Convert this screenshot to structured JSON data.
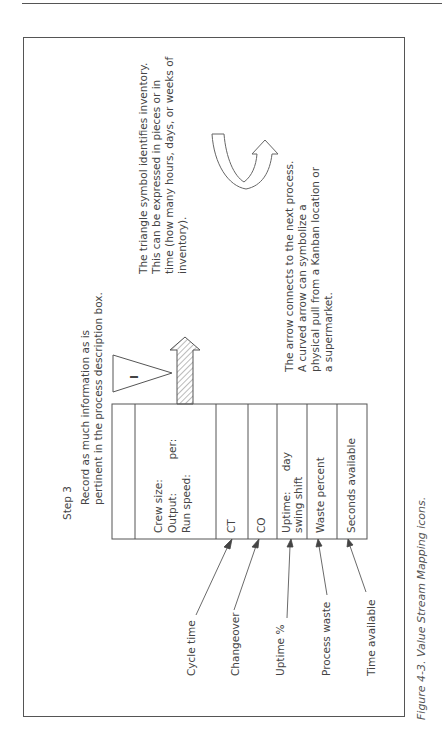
{
  "figure": {
    "step_label": "Step 3",
    "instruction_lines": [
      "Record as much information as is",
      "pertinent in the process description box."
    ],
    "caption": "Figure 4-3. Value Stream Mapping icons."
  },
  "inventory_triangle": {
    "symbol_text": "I",
    "description_lines": [
      "The triangle symbol identifies inventory.",
      "This can be expressed in pieces or in",
      "time (how many hours, days, or weeks of",
      "inventory)."
    ]
  },
  "push_arrow": {
    "description_lines": [
      "The arrow connects to the next process.",
      "A curved arrow can symbolize a",
      "physical pull from a Kanban location or",
      "a supermarket."
    ]
  },
  "process_box": {
    "rows": [
      {
        "id": "header",
        "lines": [
          ""
        ]
      },
      {
        "id": "crew",
        "lines": [
          "Crew size:",
          "Output:          per:",
          "Run speed:"
        ]
      },
      {
        "id": "ct",
        "lines": [
          "CT"
        ]
      },
      {
        "id": "co",
        "lines": [
          "CO"
        ]
      },
      {
        "id": "uptime",
        "lines": [
          "Uptime:      day",
          "swing shift"
        ]
      },
      {
        "id": "waste",
        "lines": [
          "Waste percent"
        ]
      },
      {
        "id": "seconds",
        "lines": [
          "Seconds available"
        ]
      }
    ]
  },
  "callouts": [
    {
      "label": "Cycle time"
    },
    {
      "label": "Changeover"
    },
    {
      "label": "Uptime %"
    },
    {
      "label": "Process waste"
    },
    {
      "label": "Time available"
    }
  ]
}
